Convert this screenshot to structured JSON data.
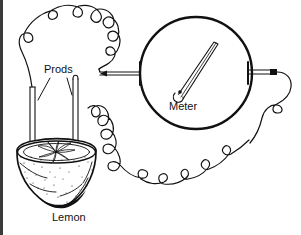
{
  "figure": {
    "background_color": "#ffffff",
    "ink_color": "#111111",
    "border": {
      "present": true,
      "side": "left",
      "color": "#3a3a3a"
    },
    "labels": {
      "prods": "Prods",
      "meter": "Meter",
      "lemon": "Lemon"
    },
    "parts": [
      {
        "name": "meter",
        "shape": "circle",
        "label": "Meter"
      },
      {
        "name": "needle",
        "shape": "tapered-pointer",
        "direction": "up-right"
      },
      {
        "name": "lemon",
        "shape": "half-cut-fruit",
        "label": "Lemon"
      },
      {
        "name": "prod-left",
        "shape": "rod"
      },
      {
        "name": "prod-right",
        "shape": "rod"
      },
      {
        "name": "wire-upper",
        "shape": "curly-wire"
      },
      {
        "name": "wire-lower",
        "shape": "coiled-wire"
      },
      {
        "name": "terminal-left",
        "shape": "lead"
      },
      {
        "name": "terminal-right",
        "shape": "lead"
      }
    ]
  }
}
